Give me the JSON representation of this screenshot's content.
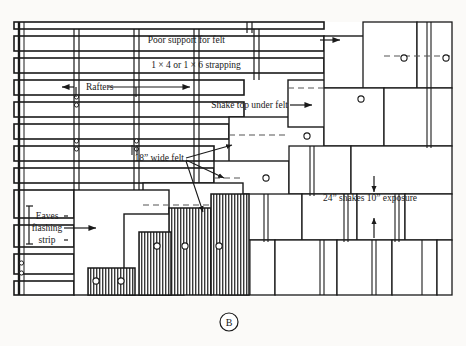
{
  "figure": {
    "caption": "B"
  },
  "labels": {
    "poor_support": "Poor support for felt",
    "strapping": "1 × 4 or 1 × 6 strapping",
    "rafters": "Rafters",
    "shake_top": "Shake top under felt",
    "wide_felt": "18” wide felt",
    "exposure": "24” shakes 10” exposure",
    "eaves_1": "Eaves",
    "eaves_2": "flashing",
    "eaves_3": "strip"
  },
  "colors": {
    "ink": "#1a1a1a",
    "paper": "#fbfaf8",
    "hatch": "#3a3a3a",
    "dash": "#555555"
  }
}
